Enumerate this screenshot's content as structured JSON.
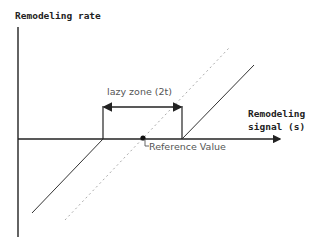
{
  "diagram": {
    "y_axis_label": "Remodeling rate",
    "x_axis_label_line1": "Remodeling",
    "x_axis_label_line2": "signal (s)",
    "lazy_zone_label": "lazy zone (2t)",
    "reference_label": "Reference Value",
    "colors": {
      "axis": "#222222",
      "solid_response": "#333333",
      "dotted_reference": "#aaaaaa",
      "reference_dot": "#111111",
      "light_text": "#555555"
    },
    "elements": [
      "y-axis",
      "x-axis",
      "lazy-zone-bracket",
      "solid-response-curve-lower",
      "solid-response-curve-upper",
      "dotted-proportional-line",
      "reference-value-marker"
    ]
  }
}
